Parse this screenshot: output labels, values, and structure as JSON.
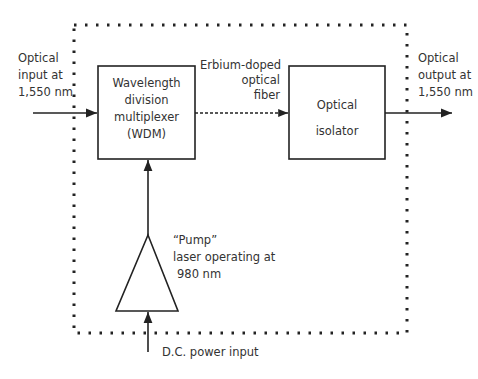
{
  "diagram": {
    "input_label": [
      "Optical",
      "input at",
      "1,550 nm"
    ],
    "output_label": [
      "Optical",
      "output at",
      "1,550 nm"
    ],
    "wdm_box": [
      "Wavelength",
      "division",
      "multiplexer",
      "(WDM)"
    ],
    "fiber_label": [
      "Erbium-doped",
      "optical",
      "fiber"
    ],
    "isolator_box": [
      "Optical",
      "isolator"
    ],
    "pump_label": [
      "“Pump”",
      "laser operating at",
      "980 nm"
    ],
    "power_label": "D.C. power input"
  }
}
